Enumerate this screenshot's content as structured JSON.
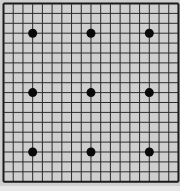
{
  "board": {
    "size": 19,
    "origin_x": 3.5,
    "origin_y": 3.5,
    "spacing_x": 9.72,
    "spacing_y": 9.9,
    "line_color": "#2a2a2a",
    "border_color": "#1a1a1a",
    "board_color": "#cfcfcf",
    "margin_color": "#e6e6e6",
    "star_points": [
      [
        3,
        3
      ],
      [
        9,
        3
      ],
      [
        15,
        3
      ],
      [
        3,
        9
      ],
      [
        9,
        9
      ],
      [
        15,
        9
      ],
      [
        3,
        15
      ],
      [
        9,
        15
      ],
      [
        15,
        15
      ]
    ],
    "stones": []
  }
}
